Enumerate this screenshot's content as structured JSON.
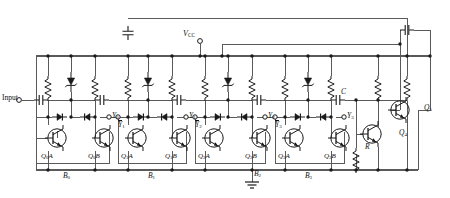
{
  "figure": {
    "type": "schematic",
    "background": "#ffffff",
    "wire_color": "#4a4a4a",
    "device_color": "#111111"
  },
  "terminals": {
    "input_label": "Input",
    "supply_label": "V",
    "supply_sub": "CC",
    "ground_node": "B2"
  },
  "stages": [
    {
      "id": "B0",
      "block_label": "B",
      "block_sub": "0",
      "transistors": [
        {
          "name": "Q",
          "sub": "0",
          "suffix": "A"
        },
        {
          "name": "Q",
          "sub": "0",
          "suffix": "B"
        }
      ],
      "output_node": {
        "label": "Y",
        "sub": "0",
        "bar": false
      },
      "input_node": null
    },
    {
      "id": "B1",
      "block_label": "B",
      "block_sub": "1",
      "transistors": [
        {
          "name": "Q",
          "sub": "1",
          "suffix": "A"
        },
        {
          "name": "Q",
          "sub": "1",
          "suffix": "B"
        }
      ],
      "output_node": {
        "label": "Y",
        "sub": "1",
        "bar": false
      },
      "input_node": {
        "label": "Y",
        "sub": "1",
        "bar": true
      }
    },
    {
      "id": "B2",
      "block_label": "B",
      "block_sub": "2",
      "transistors": [
        {
          "name": "Q",
          "sub": "2",
          "suffix": "A"
        },
        {
          "name": "Q",
          "sub": "2",
          "suffix": "B"
        }
      ],
      "output_node": {
        "label": "Y",
        "sub": "2",
        "bar": false
      },
      "input_node": {
        "label": "Y",
        "sub": "2",
        "bar": true
      }
    },
    {
      "id": "B3",
      "block_label": "B",
      "block_sub": "3",
      "transistors": [
        {
          "name": "Q",
          "sub": "3",
          "suffix": "A"
        },
        {
          "name": "Q",
          "sub": "3",
          "suffix": "B"
        }
      ],
      "output_node": {
        "label": "Y",
        "sub": "3",
        "bar": false
      },
      "input_node": {
        "label": "Y",
        "sub": "3",
        "bar": true
      }
    }
  ],
  "output_stage": {
    "coupling_cap_label": "C",
    "emitter_resistor_label": "R",
    "driver_transistor": {
      "name": "Q",
      "sub": "4"
    },
    "output_transistor": {
      "name": "Q",
      "sub": "5"
    }
  },
  "components": {
    "resistors_per_stage": 2,
    "zener_diodes_per_stage": 1,
    "signal_diodes_per_stage": 2,
    "coupling_caps": 5,
    "supply_caps": 2
  }
}
